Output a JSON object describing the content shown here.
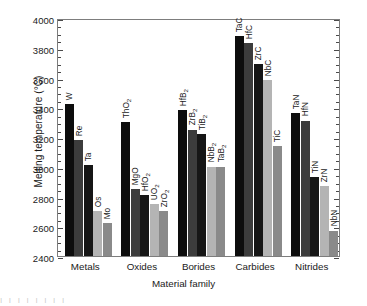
{
  "chart_data": {
    "type": "bar",
    "title": "",
    "xlabel": "Material family",
    "ylabel": "Melting temperature (°C)",
    "ylim": [
      2400,
      4000
    ],
    "ytick_step": 200,
    "yminor_step": 50,
    "grid": false,
    "legend": "none",
    "ytick_labels": [
      "2400",
      "2600",
      "2800",
      "3000",
      "3200",
      "3400",
      "3600",
      "3800",
      "4000"
    ],
    "categories": [
      "Metals",
      "Oxides",
      "Borides",
      "Carbides",
      "Nitrides"
    ],
    "groups": [
      {
        "category": "Metals",
        "bars": [
          {
            "label": "W",
            "label_html": "W",
            "value": 3420,
            "color": "#0d0d0d"
          },
          {
            "label": "Re",
            "label_html": "Re",
            "value": 3180,
            "color": "#3c3c3c"
          },
          {
            "label": "Ta",
            "label_html": "Ta",
            "value": 3010,
            "color": "#161616"
          },
          {
            "label": "Os",
            "label_html": "Os",
            "value": 2700,
            "color": "#b4b4b4"
          },
          {
            "label": "Mo",
            "label_html": "Mo",
            "value": 2620,
            "color": "#8a8a8a"
          }
        ]
      },
      {
        "category": "Oxides",
        "bars": [
          {
            "label": "ThO2",
            "label_html": "ThO<sub>2</sub>",
            "value": 3300,
            "color": "#0d0d0d"
          },
          {
            "label": "MgO",
            "label_html": "MgO",
            "value": 2850,
            "color": "#3c3c3c"
          },
          {
            "label": "HfO2",
            "label_html": "HfO<sub>2</sub>",
            "value": 2810,
            "color": "#161616"
          },
          {
            "label": "UO2",
            "label_html": "UO<sub>2</sub>",
            "value": 2750,
            "color": "#b4b4b4"
          },
          {
            "label": "ZrO2",
            "label_html": "ZrO<sub>2</sub>",
            "value": 2700,
            "color": "#8a8a8a"
          }
        ]
      },
      {
        "category": "Borides",
        "bars": [
          {
            "label": "HfB2",
            "label_html": "HfB<sub>2</sub>",
            "value": 3380,
            "color": "#0d0d0d"
          },
          {
            "label": "ZrB2",
            "label_html": "ZrB<sub>2</sub>",
            "value": 3250,
            "color": "#3c3c3c"
          },
          {
            "label": "TiB2",
            "label_html": "TiB<sub>2</sub>",
            "value": 3220,
            "color": "#161616"
          },
          {
            "label": "NbB2",
            "label_html": "NbB<sub>2</sub>",
            "value": 3000,
            "color": "#b4b4b4"
          },
          {
            "label": "TaB2",
            "label_html": "TaB<sub>2</sub>",
            "value": 3000,
            "color": "#8a8a8a"
          }
        ]
      },
      {
        "category": "Carbides",
        "bars": [
          {
            "label": "TaC",
            "label_html": "TaC",
            "value": 3880,
            "color": "#0d0d0d"
          },
          {
            "label": "HfC",
            "label_html": "HfC",
            "value": 3830,
            "color": "#3c3c3c"
          },
          {
            "label": "ZrC",
            "label_html": "ZrC",
            "value": 3690,
            "color": "#161616"
          },
          {
            "label": "NbC",
            "label_html": "NbC",
            "value": 3580,
            "color": "#b4b4b4"
          },
          {
            "label": "TiC",
            "label_html": "TiC",
            "value": 3140,
            "color": "#8a8a8a"
          }
        ]
      },
      {
        "category": "Nitrides",
        "bars": [
          {
            "label": "TaN",
            "label_html": "TaN",
            "value": 3360,
            "color": "#0d0d0d"
          },
          {
            "label": "HfN",
            "label_html": "HfN",
            "value": 3310,
            "color": "#3c3c3c"
          },
          {
            "label": "TiN",
            "label_html": "TiN",
            "value": 2930,
            "color": "#161616"
          },
          {
            "label": "ZrN",
            "label_html": "ZrN",
            "value": 2870,
            "color": "#b4b4b4"
          },
          {
            "label": "NbN",
            "label_html": "NbN",
            "value": 2570,
            "color": "#8a8a8a"
          }
        ]
      }
    ]
  },
  "axes": {
    "frame_color": "#7d7d7d",
    "tick_color": "#4a4a4a"
  },
  "artifact": {
    "text": "I I I I I I I I"
  }
}
